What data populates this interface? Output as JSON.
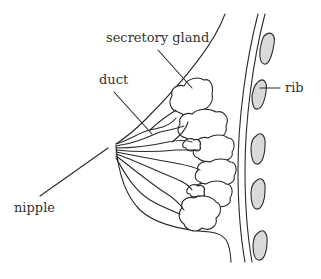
{
  "diagram": {
    "title": "",
    "labels": {
      "secretory_gland": "secretory gland",
      "duct": "duct",
      "rib": "rib",
      "nipple": "nipple"
    },
    "colors": {
      "line": "#2a2a2a",
      "rib_fill": "#d9d9d9",
      "text": "#333333",
      "background": "#ffffff"
    },
    "rib_count": 5
  }
}
